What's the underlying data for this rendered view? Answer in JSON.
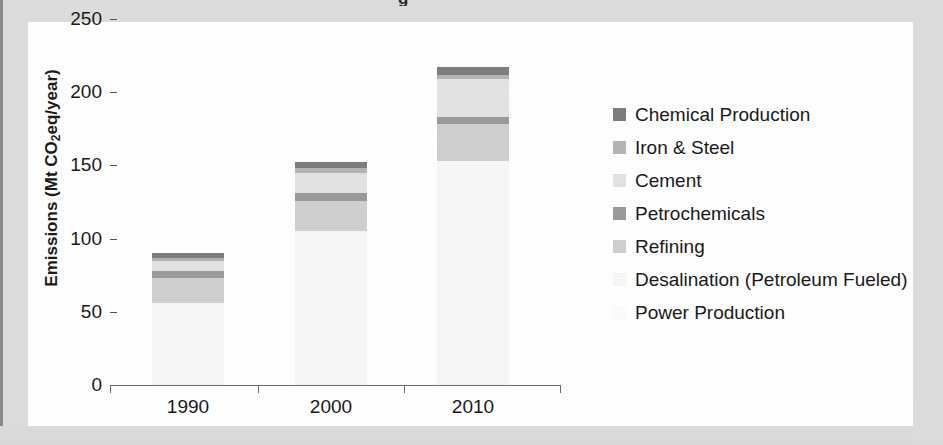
{
  "chart_data": {
    "type": "bar",
    "subtype": "stacked",
    "title": "",
    "xlabel": "",
    "ylabel": "Emissions (Mt CO2eq/year)",
    "ylabel_parts": {
      "pre": "Emissions (Mt CO",
      "sub": "2",
      "post": "eq/year)"
    },
    "categories": [
      "1990",
      "2000",
      "2010"
    ],
    "ylim": [
      0,
      250
    ],
    "yticks": [
      0,
      50,
      100,
      150,
      200,
      250
    ],
    "ytick_labels": [
      "0",
      "50",
      "100",
      "150",
      "200",
      "250"
    ],
    "grid": false,
    "legend_position": "right",
    "series": [
      {
        "name": "Chemical Production",
        "values": [
          3,
          4,
          5
        ],
        "color": "#7d7d7d"
      },
      {
        "name": "Iron & Steel",
        "values": [
          2,
          3,
          3
        ],
        "color": "#b4b4b4"
      },
      {
        "name": "Cement",
        "values": [
          7,
          14,
          26
        ],
        "color": "#e2e2e2"
      },
      {
        "name": "Petrochemicals",
        "values": [
          5,
          5,
          5
        ],
        "color": "#9a9a9a"
      },
      {
        "name": "Refining",
        "values": [
          17,
          21,
          25
        ],
        "color": "#cfcfcf"
      },
      {
        "name": "Desalination (Petroleum Fueled)",
        "values": [
          0,
          0,
          0
        ],
        "color": "#f2f2f2"
      },
      {
        "name": "Power Production",
        "values": [
          56,
          105,
          153
        ],
        "color": "#f6f6f6"
      }
    ],
    "totals": [
      90,
      152,
      217
    ],
    "stack_order_bottom_to_top": [
      "Power Production",
      "Desalination (Petroleum Fueled)",
      "Refining",
      "Petrochemicals",
      "Cement",
      "Iron & Steel",
      "Chemical Production"
    ]
  },
  "legend": {
    "items": [
      {
        "label": "Chemical Production",
        "color": "#7d7d7d"
      },
      {
        "label": "Iron & Steel",
        "color": "#b4b4b4"
      },
      {
        "label": "Cement",
        "color": "#e2e2e2"
      },
      {
        "label": "Petrochemicals",
        "color": "#9a9a9a"
      },
      {
        "label": "Refining",
        "color": "#cfcfcf"
      },
      {
        "label": "Desalination (Petroleum Fueled)",
        "color": "#f6f6f6"
      },
      {
        "label": "Power Production",
        "color": "#fbfbfb"
      }
    ]
  },
  "title_fragment": "g"
}
